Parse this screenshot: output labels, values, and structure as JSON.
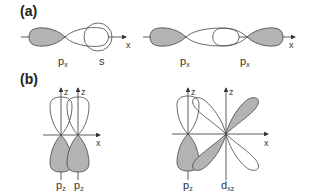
{
  "figure": {
    "panel_a": {
      "label": "(a)",
      "left_diagram": {
        "orbitals": [
          "p_x",
          "s"
        ],
        "labels": {
          "px": "p",
          "px_sub": "x",
          "s": "s"
        },
        "axis_label": "x"
      },
      "right_diagram": {
        "orbitals": [
          "p_x",
          "p_x"
        ],
        "labels": {
          "px1": "p",
          "px1_sub": "x",
          "px2": "p",
          "px2_sub": "x"
        },
        "axis_label": "x"
      }
    },
    "panel_b": {
      "label": "(b)",
      "left_diagram": {
        "orbitals": [
          "p_z",
          "p_z"
        ],
        "labels": {
          "pz1": "p",
          "pz1_sub": "z",
          "pz2": "p",
          "pz2_sub": "z"
        },
        "axis_labels": {
          "z1": "z",
          "z2": "z",
          "x": "x"
        }
      },
      "right_diagram": {
        "orbitals": [
          "p_z",
          "d_xz"
        ],
        "labels": {
          "pz": "p",
          "pz_sub": "z",
          "d": "d",
          "d_sub": "xz"
        },
        "axis_labels": {
          "z1": "z",
          "z2": "z",
          "x": "x"
        }
      }
    },
    "colors": {
      "shaded_lobe": "#b3b3b3",
      "outline": "#444444",
      "background": "#ffffff"
    }
  }
}
